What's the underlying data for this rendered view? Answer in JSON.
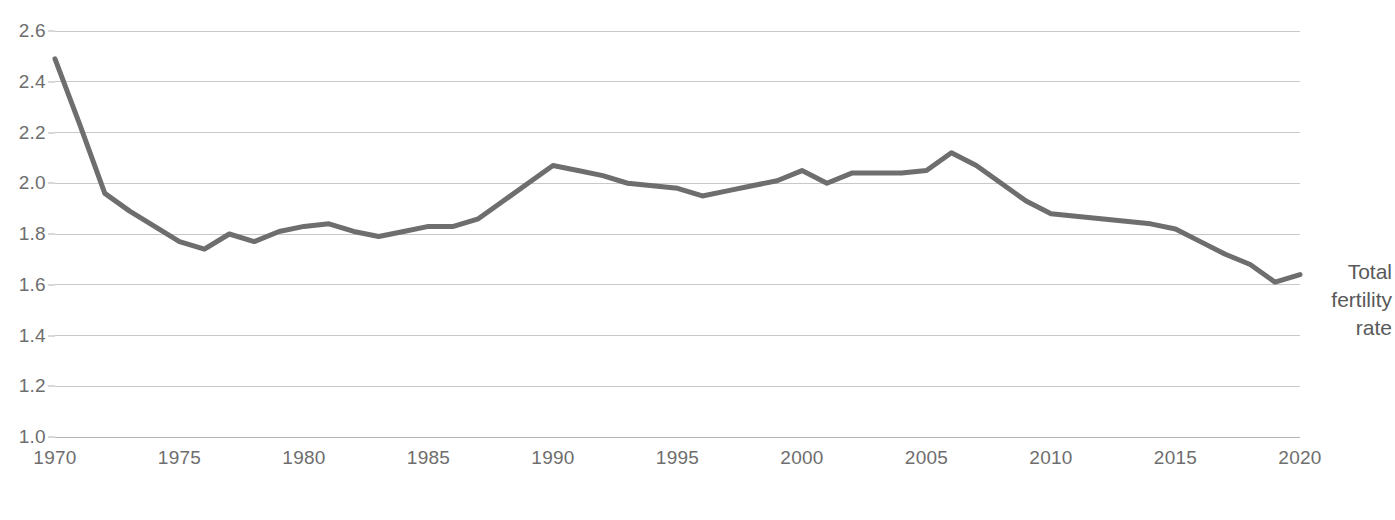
{
  "chart_data": {
    "type": "line",
    "title": "",
    "subtitle": "",
    "xlabel": "",
    "ylabel": "",
    "xlim": [
      1970,
      2020
    ],
    "ylim": [
      1.0,
      2.6
    ],
    "grid": true,
    "legend_position": "right",
    "series_label_lines": [
      "Total",
      "fertility",
      "rate"
    ],
    "series_color": "#6e6e6e",
    "gridline_color": "#c8c8c8",
    "axis_color": "#b4b4b4",
    "text_color": "#6e6e6e",
    "y_ticks": [
      "2.6",
      "2.4",
      "2.2",
      "2.0",
      "1.8",
      "1.6",
      "1.4",
      "1.2",
      "1.0"
    ],
    "x_ticks": [
      "1970",
      "1975",
      "1980",
      "1985",
      "1990",
      "1995",
      "2000",
      "2005",
      "2010",
      "2015",
      "2020"
    ],
    "x": [
      1970,
      1971,
      1972,
      1973,
      1974,
      1975,
      1976,
      1977,
      1978,
      1979,
      1980,
      1981,
      1982,
      1983,
      1984,
      1985,
      1986,
      1987,
      1988,
      1989,
      1990,
      1991,
      1992,
      1993,
      1994,
      1995,
      1996,
      1997,
      1998,
      1999,
      2000,
      2001,
      2002,
      2003,
      2004,
      2005,
      2006,
      2007,
      2008,
      2009,
      2010,
      2011,
      2012,
      2013,
      2014,
      2015,
      2016,
      2017,
      2018,
      2019,
      2020
    ],
    "series": [
      {
        "name": "Total fertility rate",
        "values": [
          2.49,
          2.23,
          1.96,
          1.89,
          1.83,
          1.77,
          1.74,
          1.8,
          1.77,
          1.81,
          1.83,
          1.84,
          1.81,
          1.79,
          1.81,
          1.83,
          1.83,
          1.86,
          1.93,
          2.0,
          2.07,
          2.05,
          2.03,
          2.0,
          1.99,
          1.98,
          1.95,
          1.97,
          1.99,
          2.01,
          2.05,
          2.0,
          2.04,
          2.04,
          2.04,
          2.05,
          2.12,
          2.07,
          2.0,
          1.93,
          1.88,
          1.87,
          1.86,
          1.85,
          1.84,
          1.82,
          1.77,
          1.72,
          1.68,
          1.61,
          1.64
        ]
      }
    ]
  }
}
